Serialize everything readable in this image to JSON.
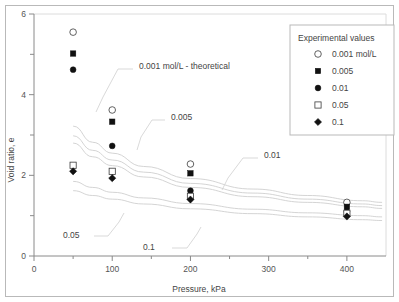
{
  "chart_data": {
    "type": "scatter",
    "title": "",
    "xlabel": "Pressure, kPa",
    "ylabel": "Void ratio, e",
    "xlim": [
      0,
      450
    ],
    "ylim": [
      0,
      6
    ],
    "xticks": [
      0,
      100,
      200,
      300,
      400
    ],
    "xtick_labels": [
      "0",
      "100",
      "200",
      "300",
      "400"
    ],
    "xminor": [
      50,
      150,
      250,
      350
    ],
    "yticks": [
      0,
      2,
      4,
      6
    ],
    "ytick_labels": [
      "0",
      "2",
      "4",
      "6"
    ],
    "yminor": [
      1,
      3,
      5
    ],
    "grid": false,
    "legend_position": "top-right",
    "legend_title": "Experimental values",
    "series": [
      {
        "name": "0.001 mol/L",
        "marker": "open-circle",
        "x": [
          50,
          100,
          200,
          400
        ],
        "y": [
          5.55,
          3.62,
          2.28,
          1.33
        ]
      },
      {
        "name": "0.005",
        "marker": "filled-square",
        "x": [
          50,
          100,
          200,
          400
        ],
        "y": [
          5.02,
          3.33,
          2.05,
          1.22
        ]
      },
      {
        "name": "0.01",
        "marker": "filled-circle",
        "x": [
          50,
          100,
          200,
          400
        ],
        "y": [
          4.62,
          2.73,
          1.62,
          1.1
        ]
      },
      {
        "name": "0.05",
        "marker": "open-square",
        "x": [
          50,
          100,
          200,
          400
        ],
        "y": [
          2.25,
          2.1,
          1.48,
          1.06
        ]
      },
      {
        "name": "0.1",
        "marker": "filled-diamond",
        "x": [
          50,
          100,
          200,
          400
        ],
        "y": [
          2.1,
          1.93,
          1.4,
          0.98
        ]
      }
    ],
    "theoretical_curves": [
      {
        "name": "0.001 mol/L - theoretical",
        "label": "0.001 mol/L - theoretical",
        "x": [
          50,
          75,
          100,
          140,
          200,
          280,
          350,
          420,
          445
        ],
        "y": [
          3.22,
          2.82,
          2.55,
          2.22,
          1.92,
          1.66,
          1.5,
          1.37,
          1.33
        ]
      },
      {
        "name": "0.005",
        "label": "0.005",
        "x": [
          50,
          75,
          100,
          140,
          200,
          280,
          350,
          420,
          445
        ],
        "y": [
          2.98,
          2.62,
          2.38,
          2.08,
          1.8,
          1.56,
          1.41,
          1.29,
          1.25
        ]
      },
      {
        "name": "0.01",
        "label": "0.01",
        "x": [
          50,
          75,
          100,
          140,
          200,
          280,
          350,
          420,
          445
        ],
        "y": [
          2.8,
          2.46,
          2.24,
          1.96,
          1.7,
          1.47,
          1.33,
          1.22,
          1.18
        ]
      },
      {
        "name": "0.05",
        "label": "0.05",
        "x": [
          50,
          75,
          100,
          140,
          200,
          280,
          350,
          420,
          445
        ],
        "y": [
          1.85,
          1.7,
          1.58,
          1.44,
          1.3,
          1.16,
          1.07,
          1.0,
          0.97
        ]
      },
      {
        "name": "0.1",
        "label": "0.1",
        "x": [
          50,
          75,
          100,
          140,
          200,
          280,
          350,
          420,
          445
        ],
        "y": [
          1.62,
          1.5,
          1.41,
          1.29,
          1.17,
          1.05,
          0.97,
          0.9,
          0.88
        ]
      }
    ],
    "annotations": [
      {
        "label": "0.001 mol/L - theoretical",
        "x": 139,
        "y": 69
      },
      {
        "label": "0.005",
        "x": 171,
        "y": 120
      },
      {
        "label": "0.01",
        "x": 264,
        "y": 158
      },
      {
        "label": "0.05",
        "x": 63,
        "y": 238
      },
      {
        "label": "0.1",
        "x": 143,
        "y": 250
      }
    ],
    "legend_entries": [
      {
        "label": "0.001 mol/L",
        "marker": "open-circle"
      },
      {
        "label": "0.005",
        "marker": "filled-square"
      },
      {
        "label": "0.01",
        "marker": "filled-circle"
      },
      {
        "label": "0.05",
        "marker": "open-square"
      },
      {
        "label": "0.1",
        "marker": "filled-diamond"
      }
    ],
    "colors": {
      "marker_fill": "#111111",
      "marker_open": "#ffffff",
      "marker_stroke": "#3a3a3a",
      "curve": "#cfcfcf",
      "axis": "#8a8a8a",
      "frame": "#b9b9b9",
      "text": "#444444",
      "background": "#ffffff"
    }
  }
}
